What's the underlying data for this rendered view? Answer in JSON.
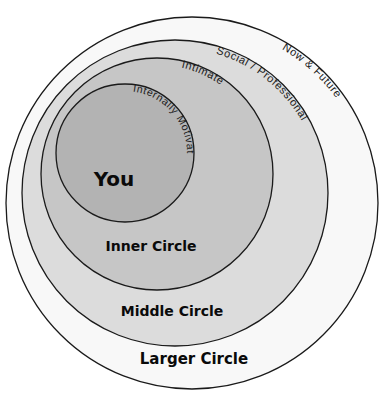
{
  "diagram": {
    "rings": [
      {
        "id": "larger",
        "cx": 192,
        "cy": 203,
        "r": 186,
        "fill": "#f8f8f8"
      },
      {
        "id": "middle",
        "cx": 175,
        "cy": 193,
        "r": 153,
        "fill": "#dcdcdc"
      },
      {
        "id": "inner",
        "cx": 157,
        "cy": 174,
        "r": 116,
        "fill": "#c6c6c6"
      },
      {
        "id": "you",
        "cx": 125,
        "cy": 153,
        "r": 69,
        "fill": "#b3b3b3"
      }
    ],
    "labels": {
      "you": "You",
      "inner_circle": "Inner Circle",
      "middle_circle": "Middle Circle",
      "larger_circle": "Larger Circle"
    },
    "arc_labels": {
      "you": "Internally Motivated",
      "inner": "Intimate",
      "middle": "Social / Professional",
      "larger": "Now & Future"
    }
  }
}
